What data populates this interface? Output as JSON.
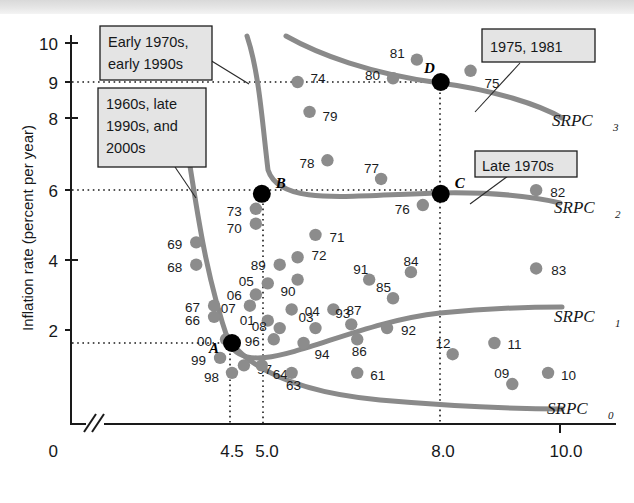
{
  "figure": {
    "name": "short-run-phillips-curves-scatter"
  },
  "axes": {
    "y_title": "Inflation rate (percent per year)",
    "x_title": "Unemployment rate (percentage of labor force)",
    "origin_label": "0",
    "y_ticks": [
      "10",
      "9",
      "8",
      "6",
      "4",
      "2"
    ],
    "x_ticks": [
      "4.5",
      "5.0",
      "8.0",
      "10.0"
    ]
  },
  "callouts": [
    {
      "id": "early-1970s",
      "lines": [
        "Early 1970s,",
        "early 1990s"
      ]
    },
    {
      "id": "1960s-late-1990s",
      "lines": [
        "1960s, late",
        "1990s, and",
        "2000s"
      ]
    },
    {
      "id": "1975-1981",
      "lines": [
        "1975, 1981"
      ]
    },
    {
      "id": "late-1970s",
      "lines": [
        "Late 1970s"
      ]
    }
  ],
  "curve_labels": [
    {
      "id": "srpc3",
      "base": "SRPC",
      "sub": "3"
    },
    {
      "id": "srpc2",
      "base": "SRPC",
      "sub": "2"
    },
    {
      "id": "srpc1",
      "base": "SRPC",
      "sub": "1"
    },
    {
      "id": "srpc0",
      "base": "SRPC",
      "sub": "0"
    }
  ],
  "key_points": [
    {
      "label": "A",
      "u": 4.5,
      "pi": 2.0
    },
    {
      "label": "B",
      "u": 5.0,
      "pi": 6.0
    },
    {
      "label": "C",
      "u": 8.0,
      "pi": 6.0
    },
    {
      "label": "D",
      "u": 8.0,
      "pi": 9.0
    }
  ],
  "chart_data": {
    "type": "scatter",
    "title": "",
    "xlabel": "Unemployment rate (percentage of labor force)",
    "ylabel": "Inflation rate (percent per year)",
    "xlim": [
      3.6,
      10.6
    ],
    "ylim": [
      0,
      10.6
    ],
    "grid": false,
    "legend": "curve labels at right: SRPC0, SRPC1, SRPC2, SRPC3",
    "point_label_meaning": "two-digit year",
    "points": [
      {
        "label": "74",
        "u": 5.6,
        "pi": 9.0
      },
      {
        "label": "80",
        "u": 7.2,
        "pi": 9.1
      },
      {
        "label": "81",
        "u": 7.6,
        "pi": 9.6
      },
      {
        "label": "75",
        "u": 8.5,
        "pi": 9.3
      },
      {
        "label": "79",
        "u": 5.8,
        "pi": 8.2
      },
      {
        "label": "78",
        "u": 6.1,
        "pi": 6.9
      },
      {
        "label": "77",
        "u": 7.0,
        "pi": 6.4
      },
      {
        "label": "76",
        "u": 7.7,
        "pi": 5.7
      },
      {
        "label": "82",
        "u": 9.6,
        "pi": 6.1
      },
      {
        "label": "73",
        "u": 4.9,
        "pi": 5.6
      },
      {
        "label": "70",
        "u": 4.9,
        "pi": 5.2
      },
      {
        "label": "71",
        "u": 5.9,
        "pi": 4.9
      },
      {
        "label": "69",
        "u": 3.9,
        "pi": 4.7
      },
      {
        "label": "68",
        "u": 3.9,
        "pi": 4.1
      },
      {
        "label": "83",
        "u": 9.6,
        "pi": 4.0
      },
      {
        "label": "89",
        "u": 5.3,
        "pi": 4.1
      },
      {
        "label": "72",
        "u": 5.6,
        "pi": 4.3
      },
      {
        "label": "90",
        "u": 5.6,
        "pi": 3.7
      },
      {
        "label": "05",
        "u": 5.1,
        "pi": 3.6
      },
      {
        "label": "06",
        "u": 4.9,
        "pi": 3.3
      },
      {
        "label": "91",
        "u": 6.8,
        "pi": 3.7
      },
      {
        "label": "84",
        "u": 7.5,
        "pi": 3.9
      },
      {
        "label": "85",
        "u": 7.2,
        "pi": 3.2
      },
      {
        "label": "07",
        "u": 4.8,
        "pi": 3.0
      },
      {
        "label": "67",
        "u": 4.2,
        "pi": 3.0
      },
      {
        "label": "66",
        "u": 4.2,
        "pi": 2.7
      },
      {
        "label": "04",
        "u": 5.5,
        "pi": 2.9
      },
      {
        "label": "87",
        "u": 6.2,
        "pi": 2.9
      },
      {
        "label": "01",
        "u": 5.1,
        "pi": 2.6
      },
      {
        "label": "08",
        "u": 5.3,
        "pi": 2.4
      },
      {
        "label": "03",
        "u": 5.9,
        "pi": 2.4
      },
      {
        "label": "93",
        "u": 6.5,
        "pi": 2.5
      },
      {
        "label": "92",
        "u": 7.1,
        "pi": 2.4
      },
      {
        "label": "00",
        "u": 4.4,
        "pi": 2.1
      },
      {
        "label": "96",
        "u": 5.2,
        "pi": 2.1
      },
      {
        "label": "94",
        "u": 5.7,
        "pi": 2.0
      },
      {
        "label": "86",
        "u": 6.6,
        "pi": 2.1
      },
      {
        "label": "11",
        "u": 8.9,
        "pi": 2.0
      },
      {
        "label": "12",
        "u": 8.2,
        "pi": 1.7
      },
      {
        "label": "99",
        "u": 4.3,
        "pi": 1.6
      },
      {
        "label": "97",
        "u": 4.7,
        "pi": 1.4
      },
      {
        "label": "98",
        "u": 4.5,
        "pi": 1.2
      },
      {
        "label": "64",
        "u": 5.0,
        "pi": 1.4
      },
      {
        "label": "63",
        "u": 5.5,
        "pi": 1.2
      },
      {
        "label": "61",
        "u": 6.6,
        "pi": 1.2
      },
      {
        "label": "09",
        "u": 9.2,
        "pi": 0.9
      },
      {
        "label": "10",
        "u": 9.8,
        "pi": 1.2
      }
    ],
    "curves": [
      {
        "name": "SRPC0",
        "through": [
          [
            4.7,
            2.0
          ],
          [
            6.0,
            1.4
          ],
          [
            8.0,
            1.0
          ],
          [
            10.2,
            0.7
          ]
        ]
      },
      {
        "name": "SRPC1",
        "through": [
          [
            4.5,
            6.2
          ],
          [
            5.0,
            3.5
          ],
          [
            6.5,
            2.8
          ],
          [
            10.2,
            2.2
          ]
        ]
      },
      {
        "name": "SRPC2",
        "through": [
          [
            5.0,
            9.4
          ],
          [
            5.6,
            6.8
          ],
          [
            7.0,
            6.3
          ],
          [
            10.2,
            5.3
          ]
        ]
      },
      {
        "name": "SRPC3",
        "through": [
          [
            5.5,
            10.2
          ],
          [
            6.5,
            9.4
          ],
          [
            8.0,
            9.0
          ],
          [
            10.2,
            8.2
          ]
        ]
      }
    ]
  }
}
